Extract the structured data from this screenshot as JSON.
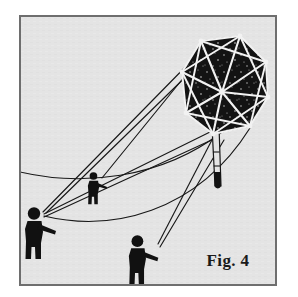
{
  "figure": {
    "caption": "Fig. 4",
    "style": "black-and-white halftone line drawing",
    "colors": {
      "page_background": "#ffffff",
      "plate_background": "#e4e4e4",
      "frame_border": "#6e6e6e",
      "ink": "#111111",
      "kite_sail": "#131313",
      "spar_highlight": "#f2f2f2",
      "caption_color": "#1a1a1a"
    },
    "frame": {
      "name": "illustration-plate-border",
      "x": 19,
      "y": 15,
      "width": 258,
      "height": 271,
      "stroke_width": 2
    }
  },
  "kite": {
    "name": "octagonal-box-kite",
    "description": "dark octagonal sail with white radial spars and perimeter frame",
    "sail_fill": "#131313",
    "spar_color": "#f2f2f2",
    "node_color": "#f2f2f2",
    "center": {
      "x": 222,
      "y": 92
    },
    "vertices": [
      {
        "x": 201,
        "y": 41
      },
      {
        "x": 240,
        "y": 36
      },
      {
        "x": 266,
        "y": 62
      },
      {
        "x": 268,
        "y": 97
      },
      {
        "x": 250,
        "y": 126
      },
      {
        "x": 213,
        "y": 134
      },
      {
        "x": 186,
        "y": 113
      },
      {
        "x": 182,
        "y": 72
      }
    ],
    "texture": "speckled halftone dots over the sail",
    "tail": {
      "name": "kite-keel-tail",
      "top": {
        "x": 215,
        "y": 128
      },
      "bottom": {
        "x": 220,
        "y": 192
      },
      "rib_count": 3,
      "tip_fill": "#131313",
      "description": "narrow tapered keel tube with cross ribs and solid rounded tip"
    }
  },
  "flyers": [
    {
      "name": "flyer-left",
      "label": "kite flyer leaning back on two lines",
      "x": 22,
      "y": 207,
      "scale": 1.0,
      "facing": "right"
    },
    {
      "name": "flyer-middle",
      "label": "kite flyer standing mid-field",
      "x": 86,
      "y": 172,
      "scale": 0.62,
      "facing": "right"
    },
    {
      "name": "flyer-front",
      "label": "kite flyer pulling a single line",
      "x": 126,
      "y": 235,
      "scale": 0.95,
      "facing": "right"
    }
  ],
  "lines": {
    "name": "flying-lines",
    "stroke": "#181818",
    "stroke_width": 1.1,
    "count": 6,
    "description": "straight control lines plus two long sagging catenary lines sweeping across the field"
  }
}
